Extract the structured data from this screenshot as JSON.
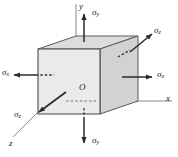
{
  "figure": {
    "name": "triaxial-stress-element"
  },
  "axes": {
    "y_label": "y",
    "x_label": "x",
    "z_label": "z",
    "origin_label": "O"
  },
  "stresses": {
    "sigma": "σ",
    "top": {
      "symbol": "σ",
      "sub": "y",
      "direction": "up"
    },
    "bottom": {
      "symbol": "σ",
      "sub": "y",
      "direction": "down"
    },
    "left": {
      "symbol": "σ",
      "sub": "x",
      "direction": "left"
    },
    "right": {
      "symbol": "σ",
      "sub": "x",
      "direction": "right"
    },
    "back_upper": {
      "symbol": "σ",
      "sub": "z",
      "direction": "up-right"
    },
    "front_lower": {
      "symbol": "σ",
      "sub": "z",
      "direction": "down-left"
    }
  },
  "colors": {
    "front_face": "#e9e9e9",
    "top_face": "#d9d9d9",
    "right_face": "#cfcfcf",
    "stroke": "#4a4a4a",
    "arrow": "#2b2b2b",
    "text": "#1a1a1a"
  }
}
